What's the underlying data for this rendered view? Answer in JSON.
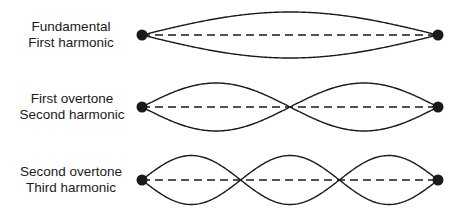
{
  "modes": [
    {
      "line1": "Fundamental",
      "line2": "First harmonic",
      "loops": 1,
      "y": 35,
      "amplitude": 23
    },
    {
      "line1": "First overtone",
      "line2": "Second harmonic",
      "loops": 2,
      "y": 107,
      "amplitude": 24
    },
    {
      "line1": "Second overtone",
      "line2": "Third harmonic",
      "loops": 3,
      "y": 180,
      "amplitude": 24.5
    }
  ],
  "string": {
    "x_start": 142,
    "x_end": 438,
    "endpoint_radius": 5.5,
    "stroke_color": "#1a1a1a"
  }
}
